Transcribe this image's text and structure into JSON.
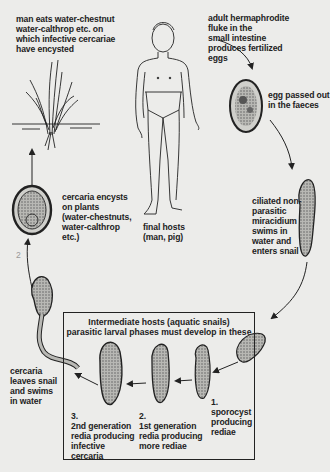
{
  "diagram": {
    "labels": {
      "man_eats": [
        "man eats water-chestnut",
        "water-calthrop etc. on",
        "which infective cercariae",
        "have encysted"
      ],
      "adult_fluke": [
        "adult hermaphrodite",
        "fluke in the",
        "small intestine",
        "produces fertilized",
        "eggs"
      ],
      "egg_passed": [
        "egg passed out",
        "in the faeces"
      ],
      "miracidium": [
        "ciliated non-",
        "parasitic",
        "miracidium",
        "swims in",
        "water and",
        "enters snail"
      ],
      "cercaria_encysts": [
        "cercaria encysts",
        "on plants",
        "(water-chestnuts,",
        "water-calthrop",
        "etc.)"
      ],
      "final_hosts": [
        "final hosts",
        "(man, pig)"
      ],
      "cercaria_leaves": [
        "cercaria",
        "leaves snail",
        "and swims",
        "in water"
      ]
    },
    "intermediate_box": {
      "title": [
        "Intermediate hosts (aquatic snails)",
        "parasitic larval phases must develop in these"
      ],
      "stages": [
        {
          "number": "1.",
          "text": [
            "sporocyst",
            "producing",
            "rediae"
          ]
        },
        {
          "number": "2.",
          "text": [
            "1st generation",
            "redia producing",
            "more rediae"
          ]
        },
        {
          "number": "3.",
          "text": [
            "2nd generation",
            "redia producing",
            "infective",
            "cercaria"
          ]
        }
      ]
    },
    "stray_mark": "2",
    "colors": {
      "background": "#ececea",
      "ink": "#222222"
    }
  }
}
